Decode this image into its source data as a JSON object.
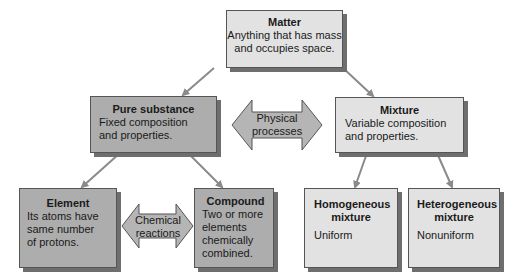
{
  "diagram": {
    "root": {
      "title": "Matter",
      "description_lines": [
        "Anything that has mass",
        "and occupies space."
      ]
    },
    "pure_substance": {
      "title": "Pure substance",
      "description_lines": [
        "Fixed composition",
        "and properties."
      ]
    },
    "mixture": {
      "title": "Mixture",
      "description_lines": [
        "Variable composition",
        "and properties."
      ]
    },
    "element": {
      "title": "Element",
      "description_lines": [
        "Its atoms have",
        "same number",
        "of protons."
      ]
    },
    "compound": {
      "title": "Compound",
      "description_lines": [
        "Two or more",
        "elements",
        "chemically",
        "combined."
      ]
    },
    "homogeneous": {
      "title_lines": [
        "Homogeneous",
        "mixture"
      ],
      "description": "Uniform"
    },
    "heterogeneous": {
      "title_lines": [
        "Heterogeneous",
        "mixture"
      ],
      "description": "Nonuniform"
    },
    "connectors": {
      "physical": [
        "Physical",
        "processes"
      ],
      "chemical": [
        "Chemical",
        "reactions"
      ]
    },
    "colors": {
      "light_box": "#e2e2e2",
      "dark_box": "#adadad",
      "arrow": "#8a8a8a",
      "double_arrow": "#b5b5b5",
      "shadow": "#6e6e6e"
    }
  }
}
